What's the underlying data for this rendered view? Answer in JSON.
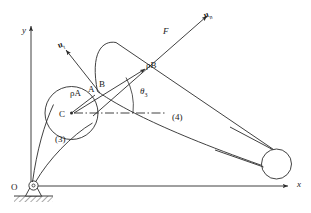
{
  "figure": {
    "background_color": "#ffffff",
    "line_color": "#2b2b2b",
    "text_color": "#1a1a1a"
  },
  "axes": {
    "y_label": "y",
    "x_label": "x",
    "origin_label": "O"
  },
  "points": {
    "A": "A",
    "B": "B",
    "C": "C"
  },
  "labels": {
    "rho_a": "ρA",
    "rho_b": "ρB",
    "theta3": "θ",
    "theta3_sub": "3",
    "force": "F",
    "link3": "(3)",
    "link4": "(4)",
    "unit_vector_t": "u",
    "unit_vector_t_sub": "t",
    "unit_vector_n": "u",
    "unit_vector_n_sub": "n"
  }
}
